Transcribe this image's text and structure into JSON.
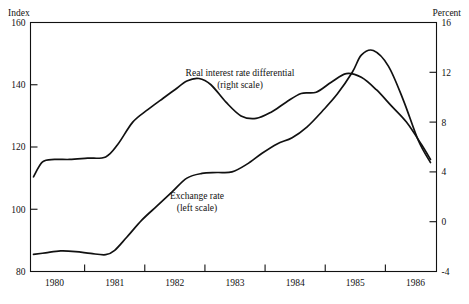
{
  "chart_data": {
    "type": "line",
    "title": "",
    "subtitle": "",
    "left_axis": {
      "label": "Index",
      "ticks": [
        80,
        100,
        120,
        140,
        160
      ],
      "ylim": [
        80,
        160
      ],
      "tick_labels": [
        "80",
        "100",
        "120",
        "140",
        "160"
      ]
    },
    "right_axis": {
      "label": "Percent",
      "ticks": [
        -4,
        0,
        4,
        8,
        12,
        16
      ],
      "ylim": [
        -4,
        16
      ],
      "tick_labels": [
        "-4",
        "0",
        "4",
        "8",
        "12",
        "16"
      ]
    },
    "xlabel": "",
    "xlim": [
      1979.6,
      1986.35
    ],
    "xticks": [
      1980,
      1981,
      1982,
      1983,
      1984,
      1985,
      1986
    ],
    "xtick_labels": [
      "1980",
      "1981",
      "1982",
      "1983",
      "1984",
      "1985",
      "1986"
    ],
    "grid": false,
    "legend_position": "inline-annotations",
    "annotations": [
      {
        "name": "real-interest-rate-differential",
        "line1": "Real interest rate differential",
        "line2": "(right scale)",
        "x": 240,
        "y": 76
      },
      {
        "name": "exchange-rate",
        "line1": "Exchange rate",
        "line2": "(left scale)",
        "x": 197,
        "y": 199
      }
    ],
    "series": [
      {
        "name": "Exchange rate (left scale)",
        "axis": "left",
        "units": "index",
        "x": [
          1979.65,
          1979.85,
          1980.1,
          1980.35,
          1980.6,
          1980.85,
          1981.0,
          1981.2,
          1981.45,
          1981.7,
          1981.95,
          1982.2,
          1982.45,
          1982.7,
          1982.95,
          1983.2,
          1983.45,
          1983.7,
          1983.95,
          1984.2,
          1984.45,
          1984.7,
          1984.95,
          1985.1,
          1985.3,
          1985.55,
          1985.8,
          1986.05,
          1986.25
        ],
        "values": [
          85.5,
          86.0,
          86.6,
          86.4,
          85.8,
          85.4,
          86.8,
          91.0,
          96.5,
          101.0,
          105.5,
          110.0,
          111.5,
          111.8,
          112.0,
          114.5,
          118.0,
          121.0,
          123.0,
          126.5,
          131.5,
          137.0,
          144.0,
          149.5,
          151.0,
          146.0,
          135.0,
          122.0,
          115.0
        ]
      },
      {
        "name": "Real interest rate differential (right scale)",
        "axis": "right",
        "units": "percent",
        "x": [
          1979.65,
          1979.8,
          1980.0,
          1980.25,
          1980.55,
          1980.85,
          1981.05,
          1981.3,
          1981.55,
          1981.8,
          1982.0,
          1982.2,
          1982.4,
          1982.6,
          1982.85,
          1983.1,
          1983.35,
          1983.6,
          1983.85,
          1984.1,
          1984.35,
          1984.6,
          1984.85,
          1985.1,
          1985.35,
          1985.6,
          1985.85,
          1986.1,
          1986.25
        ],
        "values": [
          3.6,
          4.8,
          5.0,
          5.0,
          5.1,
          5.2,
          6.2,
          8.0,
          9.0,
          9.9,
          10.6,
          11.3,
          11.5,
          11.0,
          9.6,
          8.5,
          8.3,
          8.8,
          9.6,
          10.3,
          10.4,
          11.2,
          11.9,
          11.6,
          10.6,
          9.3,
          8.0,
          6.2,
          5.0
        ]
      }
    ]
  }
}
